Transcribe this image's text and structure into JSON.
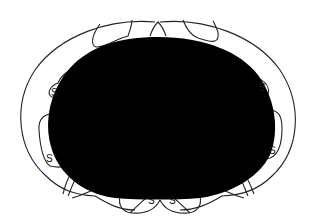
{
  "diagram": {
    "colors": {
      "mass": "#000000",
      "outline": "#222222",
      "background": "#ffffff"
    },
    "labels": [
      {
        "id": "s-upper-left",
        "text": "S"
      },
      {
        "id": "s-mid-left",
        "text": "S"
      },
      {
        "id": "s-upper-right",
        "text": "S"
      },
      {
        "id": "s-mid-right",
        "text": "S"
      },
      {
        "id": "s-bottom-left",
        "text": "S"
      },
      {
        "id": "s-bottom-right",
        "text": "S"
      }
    ]
  }
}
